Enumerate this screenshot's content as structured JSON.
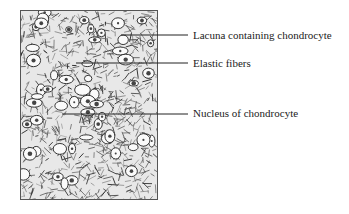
{
  "figure": {
    "labels": [
      {
        "id": "lacuna",
        "text": "Lacuna containing chondrocyte",
        "label_x": 193,
        "label_y": 29,
        "line": {
          "x1": 121,
          "y1": 35,
          "x2": 188,
          "y2": 35
        }
      },
      {
        "id": "elastic-fibers",
        "text": "Elastic fibers",
        "label_x": 193,
        "label_y": 57,
        "line": {
          "x1": 76,
          "y1": 63,
          "x2": 188,
          "y2": 63
        }
      },
      {
        "id": "nucleus",
        "text": "Nucleus of chondrocyte",
        "label_x": 193,
        "label_y": 107,
        "line": {
          "x1": 62,
          "y1": 114,
          "x2": 188,
          "y2": 114
        }
      }
    ]
  }
}
